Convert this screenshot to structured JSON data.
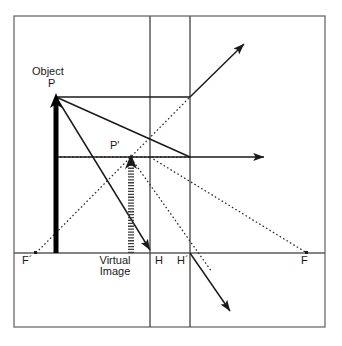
{
  "diagram": {
    "colors": {
      "line": "#4d4d4d",
      "ray": "#1a1a1a",
      "object": "#000000",
      "image": "#555555",
      "text": "#1a1a1a",
      "background": "#ffffff"
    },
    "labels": [
      {
        "name": "object-label",
        "text": "Object",
        "x": 32,
        "y": 66
      },
      {
        "name": "point-p-label",
        "text": "P",
        "x": 48,
        "y": 78
      },
      {
        "name": "point-p-prime-label",
        "text": "P'",
        "x": 110,
        "y": 140
      },
      {
        "name": "focal-point-f-prime-label",
        "text": "F´",
        "x": 22,
        "y": 255
      },
      {
        "name": "virtual-image-label-line1",
        "text": "Virtual",
        "x": 99,
        "y": 255
      },
      {
        "name": "virtual-image-label-line2",
        "text": "Image",
        "x": 103,
        "y": 266
      },
      {
        "name": "principal-plane-h-label",
        "text": "H",
        "x": 155,
        "y": 255
      },
      {
        "name": "principal-plane-h-prime-label",
        "text": "H´",
        "x": 177,
        "y": 255
      },
      {
        "name": "focal-point-f-label",
        "text": "F",
        "x": 301,
        "y": 255
      }
    ],
    "frame": {
      "x1": 14,
      "y1": 16,
      "x2": 325,
      "y2": 327
    },
    "axis": {
      "y": 253,
      "x1": 14,
      "x2": 325
    },
    "principal_planes": [
      {
        "name": "plane-H",
        "x": 150,
        "y1": 16,
        "y2": 327
      },
      {
        "name": "plane-H-prime",
        "x": 190,
        "y1": 16,
        "y2": 327
      }
    ],
    "points": {
      "P": {
        "x": 56,
        "y": 97
      },
      "P_prime": {
        "x": 131,
        "y": 158
      },
      "F_prime": {
        "x": 36,
        "y": 253
      },
      "F": {
        "x": 307,
        "y": 253
      },
      "H": {
        "x": 150,
        "y": 253
      },
      "H_prime": {
        "x": 190,
        "y": 253
      },
      "node_H_axis_mid": {
        "x": 150,
        "y": 157
      },
      "node_Hp_axis_mid": {
        "x": 190,
        "y": 157
      },
      "node_Hp_top": {
        "x": 190,
        "y": 97
      }
    },
    "object_arrow": {
      "x": 56,
      "y_base": 253,
      "y_tip": 97,
      "width": 5
    },
    "image_arrow": {
      "x": 131,
      "y_base": 253,
      "y_tip": 158,
      "width": 6
    },
    "solid_rays": [
      {
        "name": "ray-parallel-from-P",
        "points": "56,97 190,97"
      },
      {
        "name": "ray-refracted-up",
        "points": "190,97 246,42",
        "arrow": true
      },
      {
        "name": "ray-optical-axis",
        "points": "56,157 268,157",
        "arrow": true
      },
      {
        "name": "ray-from-P-to-H",
        "points": "56,97 152,253",
        "arrow": true
      },
      {
        "name": "ray-from-P-to-Hprime",
        "points": "56,97 190,157"
      },
      {
        "name": "ray-refracted-down",
        "points": "190,253 233,314",
        "arrow": true
      }
    ],
    "dotted_rays": [
      {
        "name": "dotted-back-F-prime-through-P-prime",
        "points": "36,253 190,97"
      },
      {
        "name": "dotted-horizontal-to-P-prime",
        "points": "56,157 190,157"
      },
      {
        "name": "dotted-extension-to-F",
        "points": "150,157 307,253"
      },
      {
        "name": "dotted-extension-through-H-prime",
        "points": "131,158 210,270"
      }
    ]
  }
}
